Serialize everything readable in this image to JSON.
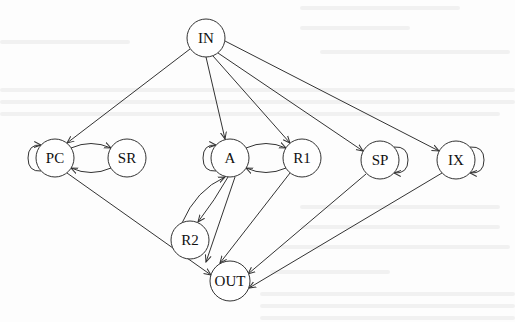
{
  "diagram": {
    "type": "directed-graph",
    "stroke_color": "#333333",
    "background": "#fdfdfd",
    "nodes": [
      {
        "id": "IN",
        "label": "IN",
        "x": 206,
        "y": 38,
        "r": 19
      },
      {
        "id": "PC",
        "label": "PC",
        "x": 55,
        "y": 158,
        "r": 19
      },
      {
        "id": "SR",
        "label": "SR",
        "x": 127,
        "y": 158,
        "r": 19
      },
      {
        "id": "A",
        "label": "A",
        "x": 230,
        "y": 158,
        "r": 19
      },
      {
        "id": "R1",
        "label": "R1",
        "x": 302,
        "y": 158,
        "r": 19
      },
      {
        "id": "SP",
        "label": "SP",
        "x": 380,
        "y": 160,
        "r": 19
      },
      {
        "id": "IX",
        "label": "IX",
        "x": 456,
        "y": 160,
        "r": 19
      },
      {
        "id": "R2",
        "label": "R2",
        "x": 190,
        "y": 240,
        "r": 19
      },
      {
        "id": "OUT",
        "label": "OUT",
        "x": 230,
        "y": 281,
        "r": 20
      }
    ],
    "edges": [
      {
        "from": "IN",
        "to": "PC"
      },
      {
        "from": "IN",
        "to": "A"
      },
      {
        "from": "IN",
        "to": "R1"
      },
      {
        "from": "IN",
        "to": "SP"
      },
      {
        "from": "IN",
        "to": "IX"
      },
      {
        "from": "PC",
        "to": "SR"
      },
      {
        "from": "SR",
        "to": "PC"
      },
      {
        "from": "PC",
        "to": "PC",
        "self_loop": "left"
      },
      {
        "from": "A",
        "to": "R1"
      },
      {
        "from": "R1",
        "to": "A"
      },
      {
        "from": "A",
        "to": "A",
        "self_loop": "left"
      },
      {
        "from": "A",
        "to": "R2"
      },
      {
        "from": "R2",
        "to": "A"
      },
      {
        "from": "SP",
        "to": "SP",
        "self_loop": "right"
      },
      {
        "from": "IX",
        "to": "IX",
        "self_loop": "right"
      },
      {
        "from": "PC",
        "to": "OUT"
      },
      {
        "from": "A",
        "to": "OUT"
      },
      {
        "from": "R1",
        "to": "OUT"
      },
      {
        "from": "SP",
        "to": "OUT"
      },
      {
        "from": "IX",
        "to": "OUT"
      }
    ]
  }
}
